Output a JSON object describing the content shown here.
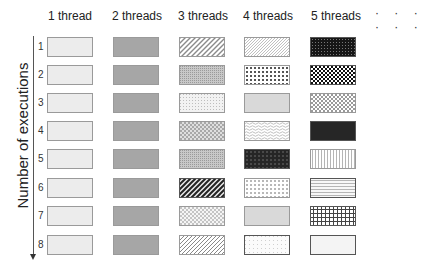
{
  "diagram": {
    "column_headers": [
      "1 thread",
      "2 threads",
      "3 threads",
      "4 threads",
      "5 threads"
    ],
    "ellipsis": "· · · · · ·",
    "axis_label": "Number of executions",
    "row_labels": [
      "1",
      "2",
      "3",
      "4",
      "5",
      "6",
      "7",
      "8"
    ],
    "cells": [
      [
        "light-gray",
        "medium-gray",
        "diagonal-light",
        "diagonal-dense-light",
        "dotted-black"
      ],
      [
        "light-gray",
        "medium-gray",
        "fine-dots-gray",
        "large-checker",
        "checker-black"
      ],
      [
        "light-gray",
        "medium-gray",
        "sparse-dots",
        "light-gray-solid",
        "checker-light"
      ],
      [
        "light-gray",
        "medium-gray",
        "small-checker",
        "wavy-horizontal",
        "dark-solid"
      ],
      [
        "light-gray",
        "medium-gray",
        "fine-dots-gray",
        "dark-dotted",
        "vertical-lines"
      ],
      [
        "light-gray",
        "medium-gray",
        "diagonal-dark",
        "dotted-grid",
        "horizontal-lines"
      ],
      [
        "light-gray",
        "medium-gray",
        "small-checker-light",
        "light-gray-solid",
        "grid"
      ],
      [
        "light-gray",
        "medium-gray",
        "diagonal-medium",
        "sparse-dots-white",
        "very-light"
      ]
    ],
    "colors": {
      "light_gray": "#ececec",
      "medium_gray": "#a6a6a6",
      "dark": "#262626",
      "border": "#9a9a9a"
    }
  }
}
